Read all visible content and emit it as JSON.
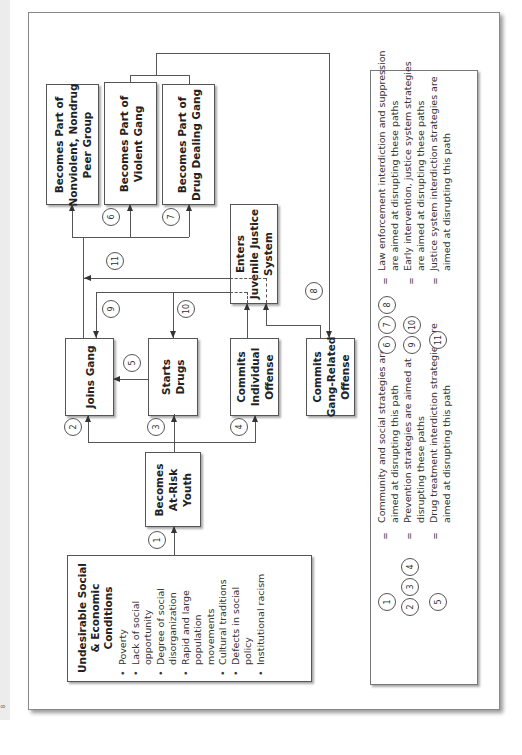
{
  "diagram": {
    "orientation": "rotated 90 degrees counter-clockwise",
    "nodes": {
      "conditions": {
        "title": "Undesirable Social & Economic Conditions",
        "title_lines": [
          "Undesirable Social",
          "& Economic",
          "Conditions"
        ],
        "items": [
          "Poverty",
          "Lack of social opportunity",
          "Degree of social disorganization",
          "Rapid and large population movements",
          "Cultural traditions",
          "Defects in social policy",
          "Institutional racism"
        ]
      },
      "at_risk": {
        "label": "Becomes At-Risk Youth",
        "lines": [
          "Becomes",
          "At-Risk",
          "Youth"
        ]
      },
      "joins_gang": {
        "label": "Joins Gang"
      },
      "starts_drugs": {
        "label": "Starts Drugs",
        "lines": [
          "Starts",
          "Drugs"
        ]
      },
      "individual_offense": {
        "label": "Commits Individual Offense",
        "lines": [
          "Commits",
          "Individual",
          "Offense"
        ]
      },
      "gang_offense": {
        "label": "Commits Gang-Related Offense",
        "lines": [
          "Commits",
          "Gang-Related",
          "Offense"
        ]
      },
      "juvenile_justice": {
        "label": "Enters Juvenile Justice System",
        "lines": [
          "Enters",
          "Juvenile Justice",
          "System"
        ]
      },
      "nonviolent": {
        "label": "Becomes Part of Nonviolent, Nondrug Peer Group",
        "lines": [
          "Becomes Part of",
          "Nonviolent, Nondrug",
          "Peer Group"
        ]
      },
      "violent": {
        "label": "Becomes Part of Violent Gang",
        "lines": [
          "Becomes Part of",
          "Violent Gang"
        ]
      },
      "drug_dealing": {
        "label": "Becomes Part of Drug Dealing Gang",
        "lines": [
          "Becomes Part of",
          "Drug Dealing Gang"
        ]
      }
    },
    "path_markers": [
      "1",
      "2",
      "3",
      "4",
      "5",
      "6",
      "7",
      "8",
      "9",
      "10",
      "11"
    ],
    "edges": [
      {
        "from": "conditions",
        "to": "at_risk",
        "marker": "1"
      },
      {
        "from": "at_risk",
        "to": "joins_gang",
        "marker": "2"
      },
      {
        "from": "at_risk",
        "to": "starts_drugs",
        "marker": "3"
      },
      {
        "from": "at_risk",
        "to": "individual_offense",
        "marker": "4"
      },
      {
        "from": "starts_drugs",
        "to": "joins_gang",
        "marker": "5"
      },
      {
        "from": "joins_gang",
        "to": "nonviolent"
      },
      {
        "from": "joins_gang",
        "to": "violent",
        "marker": "6"
      },
      {
        "from": "joins_gang",
        "to": "drug_dealing",
        "marker": "7"
      },
      {
        "from": "violent/drug_dealing",
        "to": "gang_offense",
        "marker": "8"
      },
      {
        "from": "juvenile_justice",
        "to": "joins_gang",
        "marker": "9"
      },
      {
        "from": "juvenile_justice",
        "to": "starts_drugs",
        "marker": "10"
      },
      {
        "from": "juvenile_justice",
        "to": "joins_gang path",
        "marker": "11"
      },
      {
        "from": "individual_offense",
        "to": "juvenile_justice"
      },
      {
        "from": "gang_offense",
        "to": "juvenile_justice"
      }
    ]
  },
  "legend": {
    "entries": [
      {
        "markers": [
          "1"
        ],
        "text_lines": [
          "Community and social strategies are",
          "aimed at disrupting this path"
        ]
      },
      {
        "markers": [
          "2",
          "3",
          "4"
        ],
        "text_lines": [
          "Prevention strategies are aimed at",
          "disrupting these paths"
        ]
      },
      {
        "markers": [
          "5"
        ],
        "text_lines": [
          "Drug treatment interdiction strategies are",
          "aimed at disrupting this path"
        ]
      },
      {
        "markers": [
          "6",
          "7",
          "8"
        ],
        "text_lines": [
          "Law enforcement interdiction and suppression",
          "are aimed at disrupting these paths"
        ]
      },
      {
        "markers": [
          "9",
          "10"
        ],
        "text_lines": [
          "Early intervention, justice system strategies",
          "are aimed at disrupting these paths"
        ]
      },
      {
        "markers": [
          "11"
        ],
        "text_lines": [
          "Justice system interdiction strategies are",
          "aimed at disrupting this path"
        ]
      }
    ],
    "equals": "="
  },
  "page_mark": "8"
}
